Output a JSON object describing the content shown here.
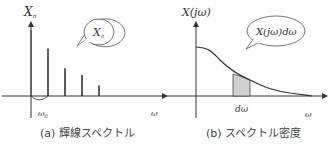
{
  "panel_a": {
    "y_label": "X",
    "y_label_sub": "n",
    "bubble_label": "X",
    "bubble_label_sub": "n",
    "x_label": "ω",
    "omega0_label": "ω",
    "omega0_sub": "0",
    "caption": "(a) 輝線スペクトル",
    "line_heights": [
      1.0,
      0.72,
      0.42,
      0.32,
      0.16
    ]
  },
  "panel_b": {
    "y_label": "X(jω)",
    "bubble_label": "X(jω)dω",
    "x_label": "ω",
    "dw_label": "dω",
    "caption": "(b) スペクトル密度"
  },
  "colors": {
    "line": "#333333",
    "shade": "#d0d0d0"
  }
}
